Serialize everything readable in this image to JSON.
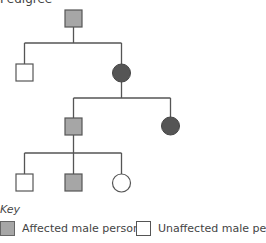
{
  "title": "Pedigree",
  "key": {
    "label": "Key",
    "items": [
      {
        "label": "Affected male person",
        "type": "affected-male"
      },
      {
        "label": "Unaffected male person",
        "type": "unaffected-male"
      }
    ]
  },
  "colors": {
    "affected_male": "#a6a6a6",
    "affected_female": "#555555",
    "unaffected": "#ffffff",
    "line": "#555555"
  },
  "pedigree": {
    "generations": [
      {
        "generation": 1,
        "individuals": [
          {
            "sex": "male",
            "affected": true
          }
        ]
      },
      {
        "generation": 2,
        "individuals": [
          {
            "sex": "male",
            "affected": false
          },
          {
            "sex": "female",
            "affected": true
          }
        ]
      },
      {
        "generation": 3,
        "individuals": [
          {
            "sex": "male",
            "affected": true
          },
          {
            "sex": "female",
            "affected": true
          }
        ]
      },
      {
        "generation": 4,
        "individuals": [
          {
            "sex": "male",
            "affected": false
          },
          {
            "sex": "male",
            "affected": true
          },
          {
            "sex": "female",
            "affected": false
          }
        ]
      }
    ]
  }
}
